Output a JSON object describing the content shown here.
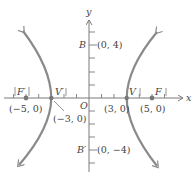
{
  "diagram": {
    "type": "hyperbola",
    "axes": {
      "x_label": "x",
      "y_label": "y",
      "origin_label": "O"
    },
    "points": {
      "F_prime": {
        "label": "F′",
        "coord": "(−5, 0)"
      },
      "V_prime": {
        "label": "V′",
        "coord": "(−3, 0)"
      },
      "V": {
        "label": "V",
        "coord": "(3, 0)"
      },
      "F": {
        "label": "F",
        "coord": "(5, 0)"
      },
      "B": {
        "label": "B",
        "coord": "(0, 4)"
      },
      "B_prime": {
        "label": "B′",
        "coord": "(0, −4)"
      }
    },
    "colors": {
      "curve": "#8a8a8a",
      "axis": "#7a7a7a",
      "point": "#777777",
      "text": "#444444"
    }
  }
}
